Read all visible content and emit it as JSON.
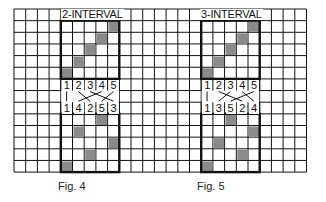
{
  "figures": [
    {
      "title": "2-INTERVAL",
      "caption": "Fig. 4",
      "top_labels": [
        "1",
        "2",
        "3",
        "4",
        "5"
      ],
      "bottom_labels": [
        "1",
        "4",
        "2",
        "5",
        "3"
      ],
      "upper_shaded_cols_by_row": [
        4,
        3,
        2,
        1,
        0
      ],
      "lower_shaded_cols_by_row": [
        3,
        1,
        4,
        2,
        0
      ]
    },
    {
      "title": "3-INTERVAL",
      "caption": "Fig. 5",
      "top_labels": [
        "1",
        "2",
        "3",
        "4",
        "5"
      ],
      "bottom_labels": [
        "1",
        "3",
        "5",
        "2",
        "4"
      ],
      "upper_shaded_cols_by_row": [
        4,
        3,
        2,
        1,
        0
      ],
      "lower_shaded_cols_by_row": [
        2,
        4,
        1,
        3,
        0
      ]
    }
  ],
  "colors": {
    "line": "#111111",
    "shade": "#8a8a8a",
    "background": "#ffffff"
  }
}
